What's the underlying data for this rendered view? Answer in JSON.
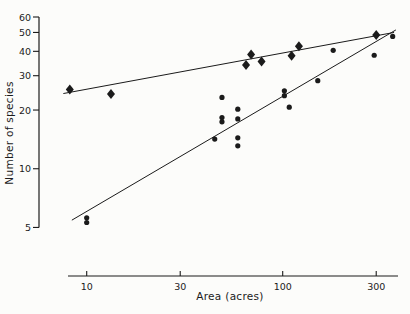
{
  "chart_data": {
    "type": "scatter",
    "title": "",
    "xlabel": "Area (acres)",
    "ylabel": "Number of species",
    "x_scale": "log",
    "y_scale": "log",
    "grid": false,
    "legend": "none",
    "x_ticks": [
      "10",
      "30",
      "100",
      "300"
    ],
    "x_tick_values": [
      10,
      30,
      100,
      300
    ],
    "y_ticks": [
      "60",
      "50",
      "40",
      "30",
      "20",
      "10",
      "5"
    ],
    "y_tick_values": [
      60,
      50,
      40,
      30,
      20,
      10,
      5
    ],
    "x_range": [
      8,
      400
    ],
    "y_range": [
      4.5,
      62
    ],
    "ink_color": "#1b1b1b",
    "background_color": "#fcfcfa",
    "series": [
      {
        "name": "diamond-series",
        "marker": "diamond",
        "points": [
          [
            8.2,
            25.5
          ],
          [
            13.3,
            24.2
          ],
          [
            65,
            34
          ],
          [
            69,
            38.5
          ],
          [
            78,
            35.5
          ],
          [
            111,
            38
          ],
          [
            121,
            42.5
          ],
          [
            300,
            48.5
          ]
        ],
        "trend_line": {
          "x1": 7.6,
          "y1": 24.3,
          "x2": 370,
          "y2": 50
        }
      },
      {
        "name": "circle-series",
        "marker": "circle",
        "points": [
          [
            10,
            5.6
          ],
          [
            10,
            5.3
          ],
          [
            45,
            14.2
          ],
          [
            49,
            23.2
          ],
          [
            49,
            18.3
          ],
          [
            49,
            17.4
          ],
          [
            59,
            20.2
          ],
          [
            59,
            18
          ],
          [
            59,
            14.4
          ],
          [
            59,
            13.1
          ],
          [
            102,
            25.1
          ],
          [
            102,
            23.7
          ],
          [
            108,
            20.7
          ],
          [
            151,
            28.3
          ],
          [
            181,
            40.5
          ],
          [
            293,
            38.2
          ],
          [
            364,
            47.7
          ]
        ],
        "trend_line": {
          "x1": 8.4,
          "y1": 5.45,
          "x2": 378,
          "y2": 51.5
        }
      }
    ]
  }
}
